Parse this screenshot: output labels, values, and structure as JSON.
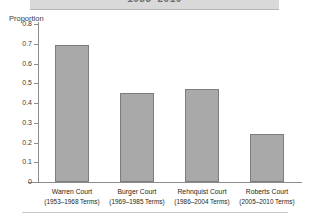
{
  "header": {
    "title": "1953–2010"
  },
  "chart_data": {
    "type": "bar",
    "title": "1953–2010",
    "xlabel": "",
    "ylabel": "Proportion",
    "ylim": [
      0,
      0.8
    ],
    "ytick_values": [
      0.8,
      0.7,
      0.6,
      0.5,
      0.4,
      0.3,
      0.2,
      0.1,
      0
    ],
    "ytick_labels": [
      "0.8",
      "0.7",
      "0.6",
      "0.5",
      "0.4",
      "0.3",
      "0.2",
      "0.1",
      "0"
    ],
    "grid": false,
    "legend": "none",
    "bar_color": "#a9a9a9",
    "bar_edge_color": "#7d7d7d",
    "categories": [
      "Warren Court",
      "Burger Court",
      "Rehnquist Court",
      "Roberts Court"
    ],
    "category_sublabels": [
      "(1953–1968 Terms)",
      "(1969–1985 Terms)",
      "(1986–2004 Terms)",
      "(2005–2010 Terms)"
    ],
    "values": [
      0.695,
      0.45,
      0.47,
      0.245
    ]
  }
}
